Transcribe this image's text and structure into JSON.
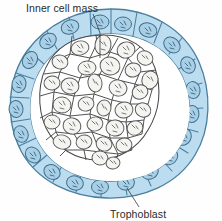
{
  "figure": {
    "background_color": "#fefefe",
    "labels": [
      {
        "id": "inner-cell-mass",
        "text": "Inner cell mass",
        "x": 26,
        "y": 11,
        "anchor": "start",
        "leader": "M 93 14 L 99 32 L 99 60"
      },
      {
        "id": "trophoblast",
        "text": "Trophoblast",
        "x": 110,
        "y": 217,
        "anchor": "start",
        "leader": "M 139 208 L 127 190"
      }
    ],
    "colors": {
      "trophoblast_fill": "#bcdcf0",
      "trophoblast_fill_light": "#cfe7f5",
      "trophoblast_stroke": "#4a7f9e",
      "trophoblast_nucleus_fill": "#a8cde4",
      "trophoblast_nucleus_stroke": "#3e6f8c",
      "icm_fill": "#ffffff",
      "icm_stroke": "#4a4a4a",
      "icm_nucleus_fill": "#f2f2f0",
      "icm_nucleus_stroke": "#555555",
      "cavity_fill": "#ffffff",
      "label_color": "#2b2b2b",
      "leader_color": "#3a3a3a"
    },
    "structures": {
      "trophoblast": {
        "name": "Trophoblast",
        "description": "Outer single cell layer forming the ring of the blastocyst",
        "cell_count": 28
      },
      "inner_cell_mass": {
        "name": "Inner cell mass",
        "description": "Cluster of embryoblast cells at upper-left interior",
        "cell_count": 32
      },
      "blastocoel": {
        "name": "Blastocoel",
        "description": "Fluid-filled cavity between inner cell mass and trophoblast"
      }
    },
    "trophoblast_cells": [
      {
        "cx": 96,
        "cy": 24,
        "rx": 16,
        "ry": 13,
        "rot": -4,
        "nx": 96,
        "ny": 25,
        "nrx": 9,
        "nry": 7
      },
      {
        "cx": 127,
        "cy": 25,
        "rx": 14,
        "ry": 13,
        "rot": 4,
        "nx": 127,
        "ny": 26,
        "nrx": 8,
        "nry": 7
      },
      {
        "cx": 156,
        "cy": 30,
        "rx": 15,
        "ry": 13,
        "rot": 14,
        "nx": 157,
        "ny": 30,
        "nrx": 9,
        "nry": 7
      },
      {
        "cx": 180,
        "cy": 43,
        "rx": 14,
        "ry": 13,
        "rot": 36,
        "nx": 181,
        "ny": 43,
        "nrx": 8,
        "nry": 7
      },
      {
        "cx": 193,
        "cy": 64,
        "rx": 13,
        "ry": 12,
        "rot": 60,
        "nx": 194,
        "ny": 64,
        "nrx": 8,
        "nry": 6
      },
      {
        "cx": 198,
        "cy": 88,
        "rx": 13,
        "ry": 12,
        "rot": 78,
        "nx": 198,
        "ny": 88,
        "nrx": 8,
        "nry": 6
      },
      {
        "cx": 197,
        "cy": 112,
        "rx": 13,
        "ry": 12,
        "rot": 92,
        "nx": 197,
        "ny": 112,
        "nrx": 8,
        "nry": 6
      },
      {
        "cx": 189,
        "cy": 135,
        "rx": 13,
        "ry": 12,
        "rot": 112,
        "nx": 189,
        "ny": 135,
        "nrx": 8,
        "nry": 6
      },
      {
        "cx": 176,
        "cy": 155,
        "rx": 13,
        "ry": 12,
        "rot": 130,
        "nx": 176,
        "ny": 155,
        "nrx": 8,
        "nry": 6
      },
      {
        "cx": 157,
        "cy": 170,
        "rx": 14,
        "ry": 12,
        "rot": 150,
        "nx": 157,
        "ny": 170,
        "nrx": 8,
        "nry": 6
      },
      {
        "cx": 133,
        "cy": 180,
        "rx": 14,
        "ry": 12,
        "rot": 168,
        "nx": 133,
        "ny": 180,
        "nrx": 8,
        "nry": 6
      },
      {
        "cx": 107,
        "cy": 183,
        "rx": 14,
        "ry": 12,
        "rot": 182,
        "nx": 107,
        "ny": 183,
        "nrx": 8,
        "nry": 6
      },
      {
        "cx": 81,
        "cy": 180,
        "rx": 14,
        "ry": 12,
        "rot": 196,
        "nx": 81,
        "ny": 180,
        "nrx": 8,
        "nry": 6
      },
      {
        "cx": 57,
        "cy": 170,
        "rx": 14,
        "ry": 12,
        "rot": 212,
        "nx": 57,
        "ny": 170,
        "nrx": 8,
        "nry": 6
      },
      {
        "cx": 38,
        "cy": 154,
        "rx": 14,
        "ry": 13,
        "rot": 230,
        "nx": 38,
        "ny": 154,
        "nrx": 8,
        "nry": 7
      },
      {
        "cx": 25,
        "cy": 133,
        "rx": 14,
        "ry": 13,
        "rot": 248,
        "nx": 25,
        "ny": 133,
        "nrx": 8,
        "nry": 7
      },
      {
        "cx": 19,
        "cy": 109,
        "rx": 14,
        "ry": 13,
        "rot": 266,
        "nx": 19,
        "ny": 109,
        "nrx": 8,
        "nry": 7
      },
      {
        "cx": 21,
        "cy": 84,
        "rx": 14,
        "ry": 13,
        "rot": 284,
        "nx": 21,
        "ny": 84,
        "nrx": 8,
        "nry": 7
      },
      {
        "cx": 31,
        "cy": 61,
        "rx": 15,
        "ry": 13,
        "rot": 302,
        "nx": 31,
        "ny": 61,
        "nrx": 9,
        "nry": 7
      },
      {
        "cx": 48,
        "cy": 43,
        "rx": 15,
        "ry": 13,
        "rot": 320,
        "nx": 48,
        "ny": 43,
        "nrx": 9,
        "nry": 7
      },
      {
        "cx": 70,
        "cy": 30,
        "rx": 15,
        "ry": 13,
        "rot": 340,
        "nx": 70,
        "ny": 30,
        "nrx": 9,
        "nry": 7
      }
    ]
  }
}
